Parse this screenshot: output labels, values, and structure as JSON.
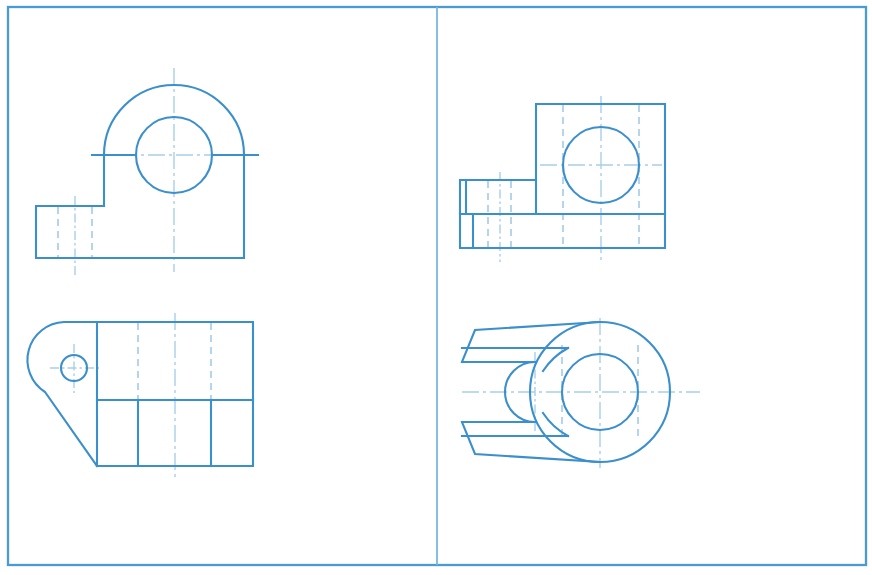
{
  "document": {
    "title": "Orthographic Engineering Drawing Sheet",
    "kind": "technical-drawing",
    "width": 872,
    "height": 575,
    "background_color": "#ffffff"
  },
  "colors": {
    "object_line": "#3a8fcc",
    "frame_line": "#4a9ad4",
    "divider_line": "#79b6e0",
    "hidden_line": "#9cc8e6",
    "center_line": "#a8cfe8"
  },
  "sheet": {
    "border": {
      "x": 8,
      "y": 7,
      "width": 858,
      "height": 558
    },
    "center_divider": {
      "x": 437,
      "y1": 7,
      "y2": 565
    }
  },
  "views": [
    {
      "id": "front-view",
      "name": "front-view-bearing-bracket",
      "quadrant": "top-left",
      "description": "Front elevation: semicircular boss with through hole over rectangular base with left side flange",
      "geometry": {
        "boss_center": {
          "x": 174,
          "y": 155
        },
        "boss_outer_radius": 70,
        "boss_hole_radius": 38,
        "base": {
          "left": 104,
          "right": 244,
          "top": 155,
          "bottom": 258
        },
        "flange": {
          "left": 36,
          "right": 104,
          "top": 206,
          "bottom": 258
        },
        "flange_hidden_lines_x": [
          58,
          92
        ],
        "flange_center_x": 75
      }
    },
    {
      "id": "top-view",
      "name": "top-view-bearing-bracket",
      "quadrant": "bottom-left",
      "description": "Top plan view: rectangular body with tapered nose and small bolt hole",
      "geometry": {
        "body": {
          "left": 97,
          "right": 253,
          "top": 322,
          "bottom": 466
        },
        "mid_horizontal_y": 400,
        "nose_apex_x": 38,
        "bolt_hole_center": {
          "x": 74,
          "y": 368
        },
        "bolt_hole_radius": 13,
        "hidden_lines_x": [
          138,
          211
        ],
        "solid_division_x": [
          138,
          211
        ],
        "center_x": 175
      }
    },
    {
      "id": "side-view",
      "name": "side-view-bearing-bracket",
      "quadrant": "top-right",
      "description": "Side elevation: stepped block profile with large circular boss outline",
      "geometry": {
        "main_block": {
          "left": 536,
          "right": 665,
          "top": 104,
          "bottom": 248
        },
        "step_block": {
          "left": 460,
          "right": 536,
          "top": 180,
          "bottom": 214
        },
        "lower_block": {
          "left": 460,
          "right": 665,
          "top": 214,
          "bottom": 248
        },
        "circle_center": {
          "x": 601,
          "y": 165
        },
        "circle_radius": 38,
        "hidden_lines_x": [
          488,
          511,
          563,
          639
        ],
        "center_x": 601,
        "center_y": 165
      }
    },
    {
      "id": "bottom-view",
      "name": "bottom-view-bearing-bracket",
      "quadrant": "bottom-right",
      "description": "Bottom plan view: forked slotted arm merging into annular ring boss",
      "geometry": {
        "ring_center": {
          "x": 600,
          "y": 392
        },
        "ring_outer_radius": 70,
        "ring_inner_radius": 38,
        "arm_top_outer_y": 330,
        "arm_top_inner_y": 348,
        "arm_bottom_inner_y": 436,
        "arm_bottom_outer_y": 454,
        "arm_left_x": 462,
        "slot_end_x": 535,
        "slot_half_height": 30,
        "slot_center_y": 392,
        "hidden_lines_x": [
          562,
          638
        ],
        "center_x": 600,
        "center_y": 392
      }
    }
  ],
  "legend": {
    "line_types": [
      {
        "label": "visible-outline",
        "style": "solid"
      },
      {
        "label": "hidden-edge",
        "style": "dashed"
      },
      {
        "label": "axis-centerline",
        "style": "dash-dot"
      }
    ]
  }
}
